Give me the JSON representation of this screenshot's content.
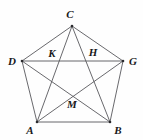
{
  "figure": {
    "kind": "geometry-diagram",
    "width": 143,
    "height": 140,
    "background_color": "#fefefe",
    "line_color": "#58585c",
    "label_color": "#18181a",
    "line_width": 0.9
  },
  "labels": {
    "C": "C",
    "D": "D",
    "G": "G",
    "A": "A",
    "B": "B",
    "K": "K",
    "H": "H",
    "M": "M"
  },
  "points": {
    "C": {
      "x": 72,
      "y": 26,
      "label_x": 70,
      "label_y": 14,
      "type": "vertex"
    },
    "D": {
      "x": 22,
      "y": 61,
      "label_x": 12,
      "label_y": 61,
      "type": "vertex"
    },
    "G": {
      "x": 123,
      "y": 61,
      "label_x": 133,
      "label_y": 61,
      "type": "vertex"
    },
    "A": {
      "x": 37,
      "y": 122,
      "label_x": 30,
      "label_y": 130,
      "type": "vertex"
    },
    "B": {
      "x": 110,
      "y": 122,
      "label_x": 118,
      "label_y": 130,
      "type": "vertex"
    },
    "K": {
      "x": 57,
      "y": 61,
      "label_x": 52,
      "label_y": 53,
      "type": "intersection"
    },
    "H": {
      "x": 88,
      "y": 61,
      "label_x": 93,
      "label_y": 52,
      "type": "intersection"
    },
    "M": {
      "x": 72,
      "y": 95,
      "label_x": 72,
      "label_y": 104,
      "type": "intersection"
    }
  },
  "segments": [
    {
      "name": "side-C-D",
      "from": "C",
      "to": "D",
      "role": "side"
    },
    {
      "name": "side-C-G",
      "from": "C",
      "to": "G",
      "role": "side"
    },
    {
      "name": "side-D-A",
      "from": "D",
      "to": "A",
      "role": "side"
    },
    {
      "name": "side-G-B",
      "from": "G",
      "to": "B",
      "role": "side"
    },
    {
      "name": "side-A-B",
      "from": "A",
      "to": "B",
      "role": "side"
    },
    {
      "name": "diagonal-D-G",
      "from": "D",
      "to": "G",
      "role": "diagonal"
    },
    {
      "name": "diagonal-C-A",
      "from": "C",
      "to": "A",
      "role": "diagonal"
    },
    {
      "name": "diagonal-C-B",
      "from": "C",
      "to": "B",
      "role": "diagonal"
    },
    {
      "name": "diagonal-D-B",
      "from": "D",
      "to": "B",
      "role": "diagonal"
    },
    {
      "name": "diagonal-A-G",
      "from": "A",
      "to": "G",
      "role": "diagonal"
    }
  ]
}
